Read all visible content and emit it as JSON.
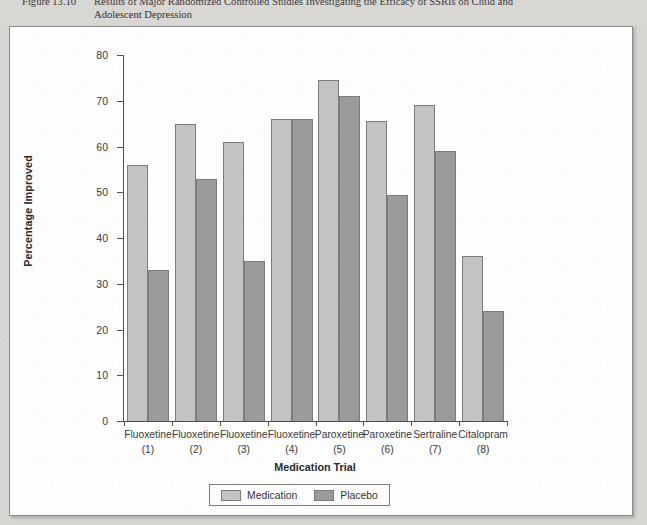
{
  "caption": {
    "figure_number": "Figure 13.10",
    "line1": "Results of Major Randomized Controlled Studies Investigating the Efficacy of SSRIs on Child and",
    "line2": "Adolescent Depression"
  },
  "chart_data": {
    "type": "bar",
    "title": "",
    "xlabel": "Medication Trial",
    "ylabel": "Percentage Improved",
    "ylim": [
      0,
      80
    ],
    "ytick_step": 10,
    "yticks": [
      "80",
      "70",
      "60",
      "50",
      "40",
      "30",
      "20",
      "10",
      "0"
    ],
    "grid": false,
    "legend_position": "bottom-center",
    "categories": [
      "Fluoxetine",
      "Fluoxetine",
      "Fluoxetine",
      "Fluoxetine",
      "Paroxetine",
      "Paroxetine",
      "Sertraline",
      "Citalopram"
    ],
    "category_numbers": [
      "(1)",
      "(2)",
      "(3)",
      "(4)",
      "(5)",
      "(6)",
      "(7)",
      "(8)"
    ],
    "series": [
      {
        "name": "Medication",
        "color": "#c3c3c3",
        "values": [
          56,
          65,
          61,
          66,
          74.5,
          65.5,
          69,
          36
        ]
      },
      {
        "name": "Placebo",
        "color": "#9b9b9b",
        "values": [
          33,
          53,
          35,
          66,
          71,
          49.5,
          59,
          24
        ]
      }
    ]
  },
  "colors": {
    "medication": "#c3c3c3",
    "placebo": "#9b9b9b",
    "axis": "#4e4e4e",
    "page": "#d8d6d2",
    "panel": "#fdfdfd"
  }
}
